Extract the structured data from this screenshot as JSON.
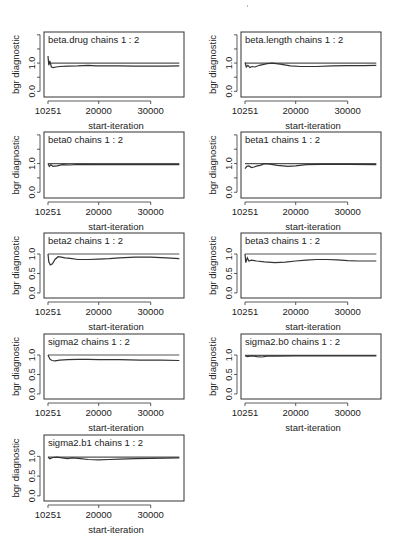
{
  "figure": {
    "width": 402,
    "height": 553,
    "line_color": "#333333",
    "ref_color": "#555555",
    "axis_color": "#333333"
  },
  "chart_data": [
    {
      "type": "line",
      "title": "beta.drug chains 1 : 2",
      "xlabel": "start-iteration",
      "ylabel": "bgr diagnostic",
      "xticks": [
        10251,
        20000,
        30000
      ],
      "yticks": [
        0.0,
        0.5,
        1.0,
        1.5,
        2.0
      ],
      "ytick_labels": [
        "0.0",
        "",
        "1.0",
        "",
        ""
      ],
      "ylim": [
        -0.2,
        2.1
      ],
      "xlim": [
        9482,
        36405
      ],
      "grid": false,
      "legend": null,
      "series": [
        {
          "name": "reference",
          "x": [
            10251,
            11000,
            12000,
            15000,
            20000,
            25000,
            30000,
            35500
          ],
          "values": [
            1.0,
            1.0,
            1.0,
            1.0,
            1.0,
            1.0,
            1.0,
            1.0
          ]
        },
        {
          "name": "bgr",
          "x": [
            10251,
            10400,
            10600,
            10900,
            11300,
            11800,
            12500,
            14000,
            16000,
            18000,
            19500,
            21000,
            24000,
            27000,
            30000,
            33000,
            35500
          ],
          "values": [
            1.25,
            0.92,
            1.08,
            0.86,
            0.84,
            0.86,
            0.88,
            0.89,
            0.9,
            0.92,
            0.9,
            0.9,
            0.9,
            0.89,
            0.89,
            0.89,
            0.9
          ]
        }
      ]
    },
    {
      "type": "line",
      "title": "beta.length chains 1 : 2",
      "xlabel": "start-iteration",
      "ylabel": "bgr diagnostic",
      "xticks": [
        10251,
        20000,
        30000
      ],
      "yticks": [
        0.0,
        0.5,
        1.0,
        1.5,
        2.0
      ],
      "ytick_labels": [
        "0.0",
        "",
        "1.0",
        "",
        ""
      ],
      "ylim": [
        -0.2,
        2.1
      ],
      "xlim": [
        9482,
        36405
      ],
      "grid": false,
      "legend": null,
      "series": [
        {
          "name": "reference",
          "x": [
            10251,
            35500
          ],
          "values": [
            1.0,
            1.0
          ]
        },
        {
          "name": "bgr",
          "x": [
            10251,
            10500,
            10800,
            11200,
            11600,
            12200,
            13000,
            14500,
            15500,
            17000,
            19000,
            21000,
            24000,
            27000,
            30000,
            33000,
            35500
          ],
          "values": [
            1.02,
            0.86,
            0.92,
            0.84,
            0.88,
            0.86,
            0.92,
            0.98,
            1.0,
            0.96,
            0.9,
            0.88,
            0.88,
            0.9,
            0.91,
            0.91,
            0.92
          ]
        }
      ]
    },
    {
      "type": "line",
      "title": "beta0 chains 1 : 2",
      "xlabel": "start-iteration",
      "ylabel": "bgr diagnostic",
      "xticks": [
        10251,
        20000,
        30000
      ],
      "yticks": [
        0.0,
        0.5,
        1.0,
        1.5,
        2.0
      ],
      "ytick_labels": [
        "0.0",
        "",
        "1.0",
        "",
        ""
      ],
      "ylim": [
        -0.2,
        2.1
      ],
      "xlim": [
        9482,
        36405
      ],
      "grid": false,
      "legend": null,
      "series": [
        {
          "name": "reference",
          "x": [
            10251,
            35500
          ],
          "values": [
            1.0,
            1.0
          ]
        },
        {
          "name": "bgr",
          "x": [
            10251,
            10500,
            10800,
            11200,
            12000,
            13000,
            14500,
            16000,
            20000,
            25000,
            30000,
            35500
          ],
          "values": [
            1.0,
            0.9,
            0.96,
            0.9,
            0.92,
            0.96,
            0.95,
            0.97,
            0.96,
            0.96,
            0.96,
            0.96
          ]
        }
      ]
    },
    {
      "type": "line",
      "title": "beta1 chains 1 : 2",
      "xlabel": "start-iteration",
      "ylabel": "bgr diagnostic",
      "xticks": [
        10251,
        20000,
        30000
      ],
      "yticks": [
        0.0,
        0.5,
        1.0,
        1.5,
        2.0
      ],
      "ytick_labels": [
        "0.0",
        "",
        "1.0",
        "",
        ""
      ],
      "ylim": [
        -0.2,
        2.1
      ],
      "xlim": [
        9482,
        36405
      ],
      "grid": false,
      "legend": null,
      "series": [
        {
          "name": "reference",
          "x": [
            10251,
            35500
          ],
          "values": [
            1.0,
            1.0
          ]
        },
        {
          "name": "bgr",
          "x": [
            10251,
            10600,
            11000,
            11500,
            12000,
            12600,
            13200,
            14000,
            15000,
            16500,
            18500,
            20000,
            22000,
            25000,
            30000,
            35500
          ],
          "values": [
            0.82,
            0.9,
            0.92,
            0.86,
            0.88,
            0.92,
            0.94,
            1.0,
            0.98,
            0.94,
            0.9,
            0.92,
            0.96,
            0.97,
            0.97,
            0.96
          ]
        }
      ]
    },
    {
      "type": "line",
      "title": "beta2 chains 1 : 2",
      "xlabel": "start-iteration",
      "ylabel": "bgr diagnostic",
      "xticks": [
        10251,
        20000,
        30000
      ],
      "yticks": [
        0.0,
        0.5,
        1.0
      ],
      "ytick_labels": [
        "0.0",
        "0.5",
        "1.0"
      ],
      "ylim": [
        -0.13,
        1.54
      ],
      "xlim": [
        9482,
        36405
      ],
      "grid": false,
      "legend": null,
      "series": [
        {
          "name": "reference",
          "x": [
            10251,
            35500
          ],
          "values": [
            1.0,
            1.0
          ]
        },
        {
          "name": "bgr",
          "x": [
            10251,
            10400,
            10700,
            11100,
            11600,
            12200,
            12800,
            13500,
            14500,
            16000,
            18000,
            20000,
            22000,
            24000,
            27000,
            30000,
            33000,
            35500
          ],
          "values": [
            1.0,
            0.8,
            0.72,
            0.75,
            0.86,
            0.93,
            0.92,
            0.9,
            0.89,
            0.86,
            0.86,
            0.87,
            0.88,
            0.9,
            0.92,
            0.92,
            0.9,
            0.88
          ]
        }
      ]
    },
    {
      "type": "line",
      "title": "beta3 chains 1 : 2",
      "xlabel": "start-iteration",
      "ylabel": "bgr diagnostic",
      "xticks": [
        10251,
        20000,
        30000
      ],
      "yticks": [
        0.0,
        0.5,
        1.0
      ],
      "ytick_labels": [
        "0.0",
        "0.5",
        "1.0"
      ],
      "ylim": [
        -0.13,
        1.54
      ],
      "xlim": [
        9482,
        36405
      ],
      "grid": false,
      "legend": null,
      "series": [
        {
          "name": "reference",
          "x": [
            10251,
            35500
          ],
          "values": [
            1.0,
            1.0
          ]
        },
        {
          "name": "bgr",
          "x": [
            10251,
            10400,
            10700,
            11000,
            11500,
            12500,
            14000,
            16000,
            18000,
            20000,
            22000,
            24000,
            26000,
            28000,
            30000,
            32000,
            35500
          ],
          "values": [
            1.0,
            0.78,
            0.9,
            0.82,
            0.84,
            0.82,
            0.8,
            0.78,
            0.79,
            0.82,
            0.84,
            0.86,
            0.86,
            0.85,
            0.83,
            0.82,
            0.82
          ]
        }
      ]
    },
    {
      "type": "line",
      "title": "sigma2 chains 1 : 2",
      "xlabel": "start-iteration",
      "ylabel": "bgr diagnostic",
      "xticks": [
        10251,
        20000,
        30000
      ],
      "yticks": [
        0.0,
        0.5,
        1.0
      ],
      "ytick_labels": [
        "0.0",
        "0.5",
        "1.0"
      ],
      "ylim": [
        -0.13,
        1.54
      ],
      "xlim": [
        9482,
        36405
      ],
      "grid": false,
      "legend": null,
      "series": [
        {
          "name": "reference",
          "x": [
            10251,
            35500
          ],
          "values": [
            1.0,
            1.0
          ]
        },
        {
          "name": "bgr",
          "x": [
            10251,
            10600,
            11000,
            11600,
            12500,
            14000,
            16000,
            18000,
            20000,
            24000,
            28000,
            32000,
            35500
          ],
          "values": [
            1.0,
            0.9,
            0.86,
            0.85,
            0.87,
            0.88,
            0.89,
            0.89,
            0.88,
            0.88,
            0.87,
            0.87,
            0.86
          ]
        }
      ]
    },
    {
      "type": "line",
      "title": "sigma2.b0 chains 1 : 2",
      "xlabel": "start-iteration",
      "ylabel": "bgr diagnostic",
      "xticks": [
        10251,
        20000,
        30000
      ],
      "yticks": [
        0.0,
        0.5,
        1.0
      ],
      "ytick_labels": [
        "0.0",
        "0.5",
        "1.0"
      ],
      "ylim": [
        -0.13,
        1.54
      ],
      "xlim": [
        9482,
        36405
      ],
      "grid": false,
      "legend": null,
      "series": [
        {
          "name": "reference",
          "x": [
            10251,
            35500
          ],
          "values": [
            0.99,
            0.99
          ]
        },
        {
          "name": "bgr",
          "x": [
            10251,
            10700,
            11500,
            12500,
            13500,
            14500,
            16000,
            20000,
            25000,
            30000,
            35500
          ],
          "values": [
            0.98,
            0.96,
            0.98,
            0.96,
            0.95,
            0.97,
            0.97,
            0.98,
            0.98,
            0.98,
            0.98
          ]
        }
      ]
    },
    {
      "type": "line",
      "title": "sigma2.b1 chains 1 : 2",
      "xlabel": "start-iteration",
      "ylabel": "bgr diagnostic",
      "xticks": [
        10251,
        20000,
        30000
      ],
      "yticks": [
        0.0,
        0.5,
        1.0
      ],
      "ytick_labels": [
        "0.0",
        "0.5",
        "1.0"
      ],
      "ylim": [
        -0.13,
        1.54
      ],
      "xlim": [
        9482,
        36405
      ],
      "grid": false,
      "legend": null,
      "series": [
        {
          "name": "reference",
          "x": [
            10251,
            35500
          ],
          "values": [
            0.98,
            0.98
          ]
        },
        {
          "name": "bgr",
          "x": [
            10251,
            10600,
            11200,
            12000,
            13000,
            14000,
            15000,
            16500,
            18000,
            20000,
            22000,
            24000,
            27000,
            30000,
            35500
          ],
          "values": [
            0.98,
            0.94,
            0.97,
            0.98,
            0.96,
            0.94,
            0.96,
            0.94,
            0.92,
            0.91,
            0.92,
            0.93,
            0.94,
            0.95,
            0.96
          ]
        }
      ]
    }
  ],
  "layout": {
    "panels": [
      {
        "box": [
          44,
          32,
          140,
          65
        ]
      },
      {
        "box": [
          241,
          32,
          140,
          65
        ]
      },
      {
        "box": [
          44,
          132,
          140,
          66
        ]
      },
      {
        "box": [
          241,
          132,
          140,
          66
        ]
      },
      {
        "box": [
          44,
          233,
          140,
          65
        ]
      },
      {
        "box": [
          241,
          233,
          140,
          65
        ]
      },
      {
        "box": [
          44,
          334,
          140,
          65
        ]
      },
      {
        "box": [
          241,
          334,
          140,
          65
        ]
      },
      {
        "box": [
          44,
          435,
          140,
          66
        ]
      }
    ]
  }
}
